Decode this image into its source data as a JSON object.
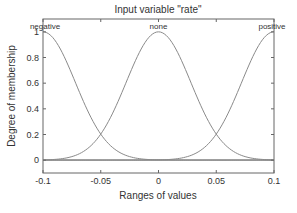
{
  "chart_data": {
    "type": "line",
    "title": "Input  variable \"rate\"",
    "xlabel": "Ranges of values",
    "ylabel": "Degree of membership",
    "xlim": [
      -0.1,
      0.1
    ],
    "ylim": [
      -0.1,
      1.1
    ],
    "grid": false,
    "legend": "none",
    "x_ticks": [
      "-0.1",
      "-0.05",
      "0",
      "0.05",
      "0.1"
    ],
    "y_ticks": [
      "0",
      "0.2",
      "0.4",
      "0.6",
      "0.8",
      "1"
    ],
    "series": [
      {
        "name": "negative",
        "shape": "gaussian",
        "center": -0.1,
        "sigma": 0.028,
        "label_x": -0.1
      },
      {
        "name": "none",
        "shape": "gaussian",
        "center": 0.0,
        "sigma": 0.028,
        "label_x": 0.0
      },
      {
        "name": "positive",
        "shape": "gaussian",
        "center": 0.1,
        "sigma": 0.028,
        "label_x": 0.1
      }
    ],
    "annotations": [
      "negative",
      "none",
      "positive"
    ],
    "colors": {
      "curve": "#8a8a8a",
      "axis": "#555555",
      "text": "#333333"
    }
  }
}
